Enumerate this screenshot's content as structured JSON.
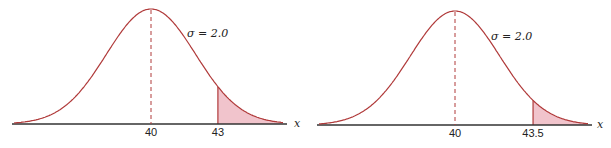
{
  "chart_data": [
    {
      "type": "area",
      "title": "",
      "description": "Normal distribution curve with right-tail shaded area",
      "mean": 40,
      "sigma": 2.0,
      "sigma_label": "σ = 2.0",
      "xlabel": "x",
      "tick_labels": [
        "40",
        "43"
      ],
      "shaded_from": 43,
      "shaded_region": "right tail",
      "mean_line": "dashed",
      "grid": false,
      "colors": {
        "curve": "#b03a3a",
        "shade": "#f1c4cc",
        "axis": "#333333"
      }
    },
    {
      "type": "area",
      "title": "",
      "description": "Normal distribution curve with right-tail shaded area",
      "mean": 40,
      "sigma": 2.0,
      "sigma_label": "σ = 2.0",
      "xlabel": "x",
      "tick_labels": [
        "40",
        "43.5"
      ],
      "shaded_from": 43.5,
      "shaded_region": "right tail",
      "mean_line": "dashed",
      "grid": false,
      "colors": {
        "curve": "#b03a3a",
        "shade": "#f1c4cc",
        "axis": "#333333"
      }
    }
  ]
}
